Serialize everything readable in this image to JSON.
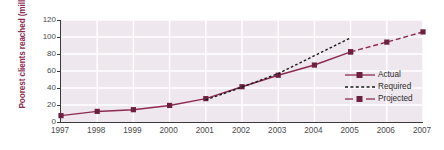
{
  "chart_data": {
    "type": "line",
    "title": "",
    "subtitle": "",
    "xlabel": "",
    "ylabel": "Poorest clients reached (millions)",
    "x": [
      1997,
      1998,
      1999,
      2000,
      2001,
      2002,
      2003,
      2004,
      2005,
      2006,
      2007
    ],
    "categories": [
      "1997",
      "1998",
      "1999",
      "2000",
      "2001",
      "2002",
      "2003",
      "2004",
      "2005",
      "2006",
      "2007"
    ],
    "xlim": [
      1997,
      2007
    ],
    "ylim": [
      0,
      120
    ],
    "yticks": [
      0,
      20,
      40,
      60,
      80,
      100,
      120
    ],
    "ytick_labels": [
      "0",
      "20",
      "40",
      "60",
      "80",
      "100",
      "120"
    ],
    "grid": true,
    "grid_color": "#ffffff",
    "plot_background": "#efe7ee",
    "legend_position": "lower right",
    "series": [
      {
        "name": "Actual",
        "style": "solid",
        "marker": "square",
        "color": "#8c2b52",
        "x": [
          1997,
          1998,
          1999,
          2000,
          2001,
          2002,
          2003,
          2004,
          2005
        ],
        "values": [
          7.5,
          12.5,
          14.5,
          19.5,
          27.5,
          41.5,
          55,
          67,
          82.5
        ]
      },
      {
        "name": "Required",
        "style": "dotted",
        "marker": "none",
        "color": "#1a1a1a",
        "x": [
          2001,
          2002,
          2003,
          2004,
          2005
        ],
        "values": [
          26,
          41,
          57,
          78,
          99
        ]
      },
      {
        "name": "Projected",
        "style": "dashed",
        "marker": "square",
        "color": "#8c2b52",
        "x": [
          2005,
          2006,
          2007
        ],
        "values": [
          82.5,
          94,
          106
        ]
      }
    ]
  },
  "axis": {
    "y_title": "Poorest clients reached (millions)",
    "y_ticks": [
      "120",
      "100",
      "80",
      "60",
      "40",
      "20",
      "0"
    ],
    "x_ticks": [
      "1997",
      "1998",
      "1999",
      "2000",
      "2001",
      "2002",
      "2003",
      "2004",
      "2005",
      "2006",
      "2007"
    ]
  },
  "legend": {
    "items": [
      {
        "label": "Actual"
      },
      {
        "label": "Required"
      },
      {
        "label": "Projected"
      }
    ]
  },
  "colors": {
    "accent": "#8c2b52",
    "required_line": "#1a1a1a",
    "plot_bg": "#efe7ee",
    "grid": "#ffffff",
    "axis": "#3a3a3a",
    "tick_text": "#4a4a4a"
  }
}
